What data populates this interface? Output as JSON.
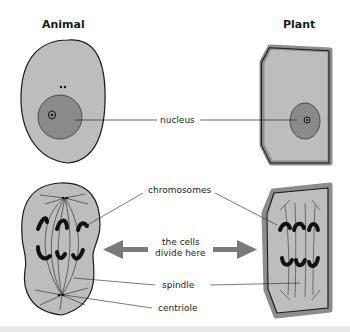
{
  "titles": {
    "animal": "Animal",
    "plant": "Plant"
  },
  "labels": {
    "nucleus": "nucleus",
    "chromosomes": "chromosomes",
    "divide_line1": "the cells",
    "divide_line2": "divide here",
    "spindle": "spindle",
    "centriole": "centriole"
  },
  "colors": {
    "cytoplasm": "#bdbdbd",
    "nucleus": "#8a8a8a",
    "cell_wall": "#8c8c8c",
    "outline": "#1a1a1a",
    "arrow": "#7a7a7a",
    "chromosome": "#111111"
  }
}
